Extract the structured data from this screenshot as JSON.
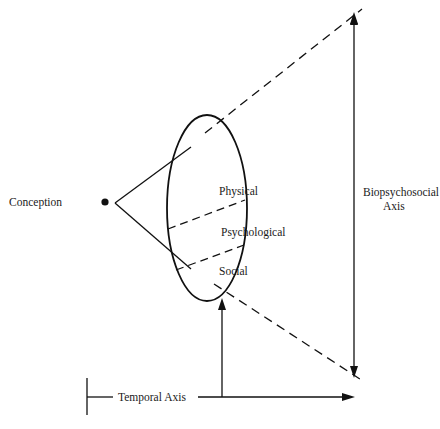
{
  "diagram": {
    "labels": {
      "conception": "Conception",
      "physical": "Physical",
      "psychological": "Psychological",
      "social": "Social",
      "biopsychosocial_line1": "Biopsychosocial",
      "biopsychosocial_line2": "Axis",
      "temporal_axis": "Temporal Axis"
    },
    "colors": {
      "ink": "#111111",
      "background": "#ffffff"
    }
  }
}
